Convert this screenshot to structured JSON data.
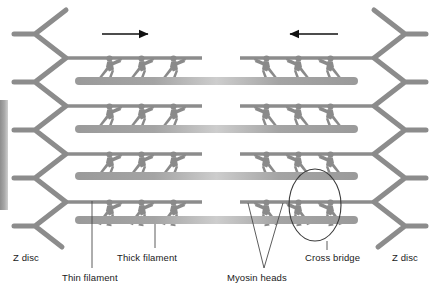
{
  "figure": {
    "background_color": "#ffffff",
    "colors": {
      "filament_gray": "#8c8c8c",
      "thick_filament_gray": "#a0a0a0",
      "thick_filament_light": "#c9c9c9",
      "figure_gray": "#8a8a8a",
      "arrow_black": "#111111",
      "label_text": "#1a1a1a",
      "leader_line": "#4a4a4a",
      "edge_bar": "#9a9a9a"
    },
    "labels": {
      "z_disc_left": "Z disc",
      "z_disc_right": "Z disc",
      "thin_filament": "Thin filament",
      "thick_filament": "Thick filament",
      "myosin_heads": "Myosin heads",
      "cross_bridge": "Cross bridge"
    },
    "structure": {
      "rows": 4,
      "figures_per_half_row": 3,
      "arrow_left_direction": "right",
      "arrow_right_direction": "left",
      "highlight_shape": "ellipse",
      "highlight_target": "cross-bridge"
    }
  }
}
